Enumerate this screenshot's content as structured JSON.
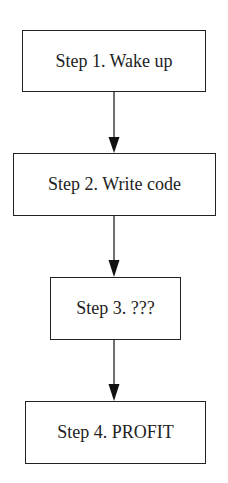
{
  "diagram": {
    "type": "flowchart",
    "direction": "top-to-bottom",
    "steps": [
      {
        "label": "Step 1. Wake up"
      },
      {
        "label": "Step 2. Write code"
      },
      {
        "label": "Step 3. ???"
      },
      {
        "label": "Step 4. PROFIT"
      }
    ],
    "edges": [
      {
        "from": 0,
        "to": 1
      },
      {
        "from": 1,
        "to": 2
      },
      {
        "from": 2,
        "to": 3
      }
    ],
    "colors": {
      "stroke": "#222222",
      "fill": "#ffffff",
      "background": "#ffffff"
    }
  }
}
